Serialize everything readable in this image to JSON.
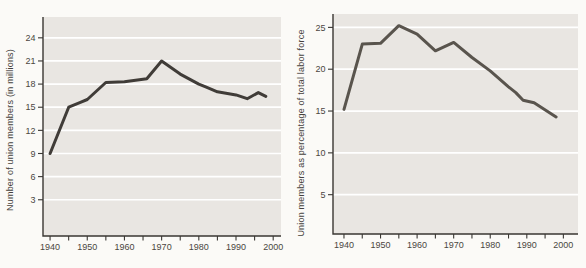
{
  "page": {
    "background": "#fbfaf7"
  },
  "chart_data": [
    {
      "type": "line",
      "title": "",
      "ylabel": "Number of union members (in millions)",
      "xlabel": "",
      "x": [
        1940,
        1945,
        1948,
        1950,
        1955,
        1960,
        1966,
        1970,
        1975,
        1980,
        1982,
        1985,
        1990,
        1993,
        1996,
        1998
      ],
      "values": [
        9.0,
        15.0,
        15.6,
        16.0,
        18.2,
        18.3,
        18.7,
        21.0,
        19.3,
        18.0,
        17.6,
        17.0,
        16.6,
        16.1,
        16.9,
        16.4
      ],
      "yticks": [
        3,
        6,
        9,
        12,
        15,
        18,
        21,
        24
      ],
      "xticks": [
        1940,
        1950,
        1960,
        1970,
        1980,
        1990,
        2000
      ],
      "x_minor_tick_step": 5,
      "ylim": [
        -1.7,
        26.7
      ],
      "xlim": [
        1938.1,
        2002.1
      ],
      "grid": "horizontal",
      "legend": "none",
      "gridline_color": "#ffffff",
      "line_color": "#403c38",
      "plot_bg": "#e9e6e2",
      "axis_color": "#3a3733",
      "label_color": "#4a4641"
    },
    {
      "type": "line",
      "title": "",
      "ylabel": "Union members as percentage of total labor force",
      "xlabel": "",
      "x": [
        1940,
        1945,
        1950,
        1955,
        1960,
        1965,
        1970,
        1975,
        1980,
        1985,
        1987,
        1989,
        1992,
        1998
      ],
      "values": [
        15.2,
        23.0,
        23.1,
        25.2,
        24.2,
        22.2,
        23.2,
        21.4,
        19.8,
        17.9,
        17.2,
        16.3,
        16.0,
        14.3
      ],
      "yticks": [
        5,
        10,
        15,
        20,
        25
      ],
      "xticks": [
        1940,
        1950,
        1960,
        1970,
        1980,
        1990,
        2000
      ],
      "x_minor_tick_step": 5,
      "ylim": [
        0.3,
        26.6
      ],
      "xlim": [
        1937,
        2004
      ],
      "grid": "horizontal",
      "legend": "none",
      "gridline_color": "#ffffff",
      "line_color": "#59544d",
      "plot_bg": "#e9e6e2",
      "axis_color": "#3a3733",
      "label_color": "#4a4641"
    }
  ]
}
